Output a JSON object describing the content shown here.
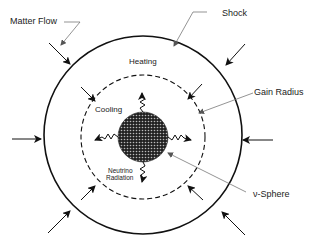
{
  "diagram": {
    "labels": {
      "matter_flow": "Matter Flow",
      "shock": "Shock",
      "heating": "Heating",
      "gain_radius": "Gain Radius",
      "cooling": "Cooling",
      "neutrino_line1": "Neutrino",
      "neutrino_line2": "Radiation",
      "nu_sphere": "ν-Sphere"
    },
    "colors": {
      "stroke": "#111111",
      "pointer": "#777777",
      "core": "#333333"
    }
  }
}
